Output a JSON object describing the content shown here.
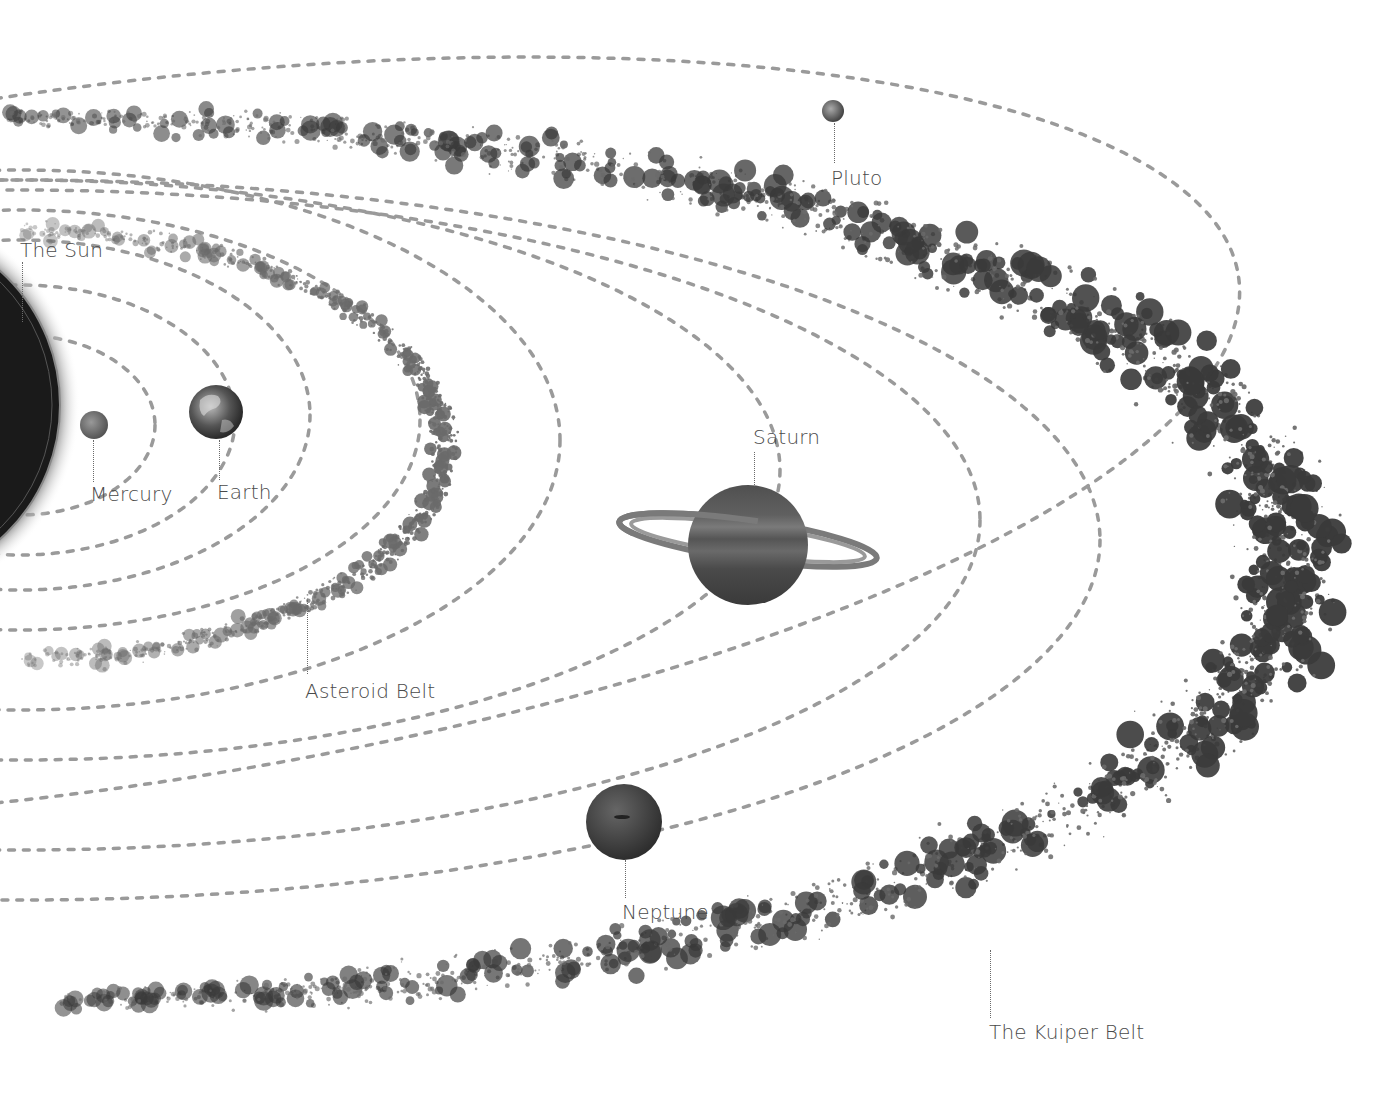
{
  "diagram": {
    "colors": {
      "background": "#ffffff",
      "orbit": "#9a9a9a",
      "belt_dark": "#3a3a3a",
      "belt_mid": "#6a6a6a",
      "label": "#4a4a4a",
      "sun": "#151515"
    },
    "labels": {
      "sun": "The Sun",
      "mercury": "Mercury",
      "earth": "Earth",
      "asteroid_belt": "Asteroid Belt",
      "saturn": "Saturn",
      "neptune": "Neptune",
      "pluto": "Pluto",
      "kuiper_belt": "The Kuiper Belt"
    },
    "bodies": [
      {
        "name": "sun",
        "cx": -120,
        "cy": 405,
        "r": 180
      },
      {
        "name": "mercury",
        "cx": 94,
        "cy": 425,
        "r": 15
      },
      {
        "name": "earth",
        "cx": 216,
        "cy": 412,
        "r": 27
      },
      {
        "name": "saturn",
        "cx": 748,
        "cy": 545,
        "r": 60
      },
      {
        "name": "neptune",
        "cx": 624,
        "cy": 822,
        "r": 38
      },
      {
        "name": "pluto",
        "cx": 833,
        "cy": 111,
        "r": 12
      }
    ],
    "orbits": [
      {
        "name": "mercury-orbit",
        "cx": 20,
        "cy": 425,
        "rx": 135,
        "ry": 90
      },
      {
        "name": "venus-orbit",
        "cx": 20,
        "cy": 420,
        "rx": 215,
        "ry": 135
      },
      {
        "name": "earth-orbit",
        "cx": 20,
        "cy": 415,
        "rx": 290,
        "ry": 175
      },
      {
        "name": "mars-orbit",
        "cx": 20,
        "cy": 420,
        "rx": 400,
        "ry": 210
      },
      {
        "name": "jupiter-orbit",
        "cx": 20,
        "cy": 440,
        "rx": 540,
        "ry": 270
      },
      {
        "name": "saturn-orbit",
        "cx": 20,
        "cy": 470,
        "rx": 760,
        "ry": 290
      },
      {
        "name": "uranus-orbit",
        "cx": 20,
        "cy": 520,
        "rx": 960,
        "ry": 330
      },
      {
        "name": "neptune-orbit",
        "cx": 20,
        "cy": 540,
        "rx": 1080,
        "ry": 360
      },
      {
        "name": "pluto-orbit",
        "cx": 80,
        "cy": 440,
        "rx": 1170,
        "ry": 350,
        "rotate": -8
      }
    ]
  }
}
